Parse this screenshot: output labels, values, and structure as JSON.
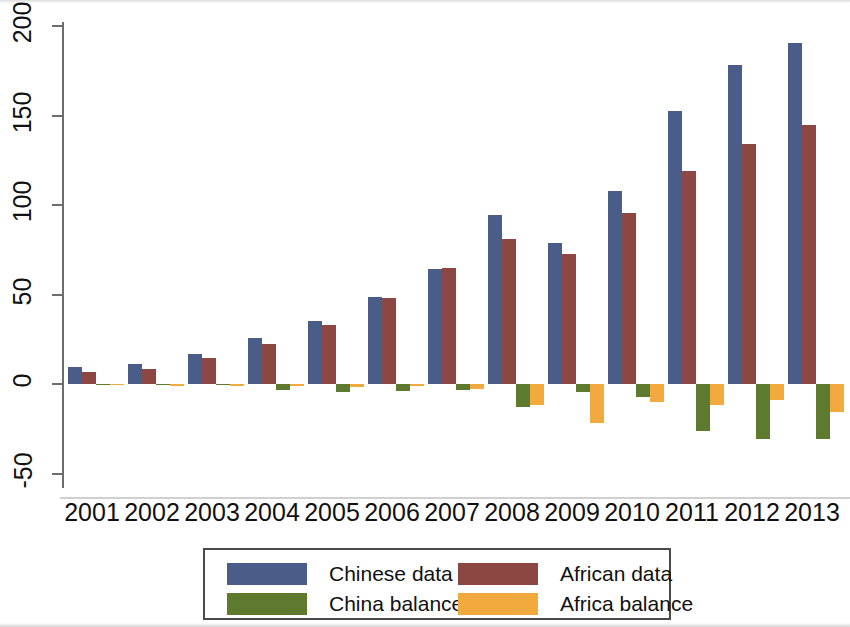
{
  "chart_data": {
    "type": "bar",
    "title": "",
    "subtitle": "",
    "xlabel": "",
    "ylabel": "",
    "grid": false,
    "ylim": [
      -50,
      200
    ],
    "yticks": [
      -50,
      0,
      50,
      100,
      150,
      200
    ],
    "ytick_labels": [
      "-50",
      "0",
      "50",
      "100",
      "150",
      "200"
    ],
    "categories": [
      "2001",
      "2002",
      "2003",
      "2004",
      "2005",
      "2006",
      "2007",
      "2008",
      "2009",
      "2010",
      "2011",
      "2012",
      "2013"
    ],
    "legend_position": "bottom",
    "series": [
      {
        "name": "Chinese data",
        "color": "#4a5c88",
        "values": [
          9.5,
          11,
          17,
          25.5,
          35,
          48.5,
          64.5,
          94.5,
          78.5,
          108,
          152.5,
          178,
          190.5
        ]
      },
      {
        "name": "African data",
        "color": "#8d4742",
        "values": [
          6.5,
          8.5,
          14.5,
          22.5,
          33,
          48,
          65,
          81,
          72.5,
          95.5,
          119,
          134,
          144.5
        ]
      },
      {
        "name": "China balance",
        "color": "#5d7a2f",
        "values": [
          -0.5,
          -0.8,
          -0.8,
          -3.5,
          -4.5,
          -4,
          -3.5,
          -13,
          -4.5,
          -7,
          -26.5,
          -31,
          -30.5
        ]
      },
      {
        "name": "Africa balance",
        "color": "#f2a93e",
        "values": [
          -0.5,
          -1,
          -1,
          -1,
          -1.5,
          -1,
          -3,
          -12,
          -22,
          -10,
          -11.5,
          -9,
          -15.5
        ]
      }
    ]
  },
  "legend": {
    "items": [
      {
        "label": "Chinese data",
        "color": "#4a5c88"
      },
      {
        "label": "African data",
        "color": "#8d4742"
      },
      {
        "label": "China balance",
        "color": "#5d7a2f"
      },
      {
        "label": "Africa balance",
        "color": "#f2a93e"
      }
    ]
  }
}
